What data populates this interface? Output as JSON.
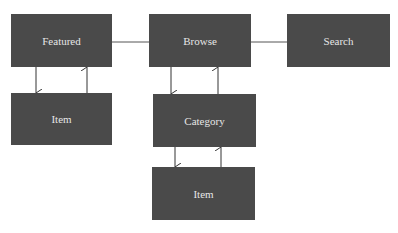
{
  "diagram": {
    "nodes": [
      {
        "id": "featured",
        "label": "Featured",
        "x": 11,
        "y": 14,
        "w": 101,
        "h": 53
      },
      {
        "id": "browse",
        "label": "Browse",
        "x": 149,
        "y": 14,
        "w": 102,
        "h": 53
      },
      {
        "id": "search",
        "label": "Search",
        "x": 287,
        "y": 14,
        "w": 103,
        "h": 53
      },
      {
        "id": "item-featured",
        "label": "Item",
        "x": 11,
        "y": 93,
        "w": 101,
        "h": 52
      },
      {
        "id": "category",
        "label": "Category",
        "x": 153,
        "y": 94,
        "w": 103,
        "h": 53
      },
      {
        "id": "item-category",
        "label": "Item",
        "x": 152,
        "y": 167,
        "w": 103,
        "h": 53
      }
    ],
    "edges": [
      {
        "from": "featured",
        "to": "browse",
        "type": "line"
      },
      {
        "from": "browse",
        "to": "search",
        "type": "line"
      },
      {
        "from": "featured",
        "to": "item-featured",
        "type": "arrow"
      },
      {
        "from": "item-featured",
        "to": "featured",
        "type": "arrow"
      },
      {
        "from": "browse",
        "to": "category",
        "type": "arrow"
      },
      {
        "from": "category",
        "to": "browse",
        "type": "arrow"
      },
      {
        "from": "category",
        "to": "item-category",
        "type": "arrow"
      },
      {
        "from": "item-category",
        "to": "category",
        "type": "arrow"
      }
    ],
    "colors": {
      "node_fill": "#4a4a4a",
      "node_text": "#e6e6e6",
      "edge": "#3a3a3a"
    }
  }
}
